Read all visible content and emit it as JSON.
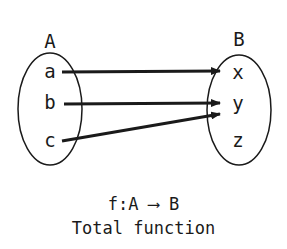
{
  "sets": {
    "domain": {
      "name": "A",
      "elements": [
        "a",
        "b",
        "c"
      ]
    },
    "codomain": {
      "name": "B",
      "elements": [
        "x",
        "y",
        "z"
      ]
    }
  },
  "mappings": [
    {
      "from": "a",
      "to": "x"
    },
    {
      "from": "b",
      "to": "y"
    },
    {
      "from": "c",
      "to": "y"
    }
  ],
  "caption": {
    "notation": "f:A ⟶ B",
    "title": "Total function"
  },
  "colors": {
    "ink": "#1a1a1a",
    "background": "#ffffff"
  }
}
